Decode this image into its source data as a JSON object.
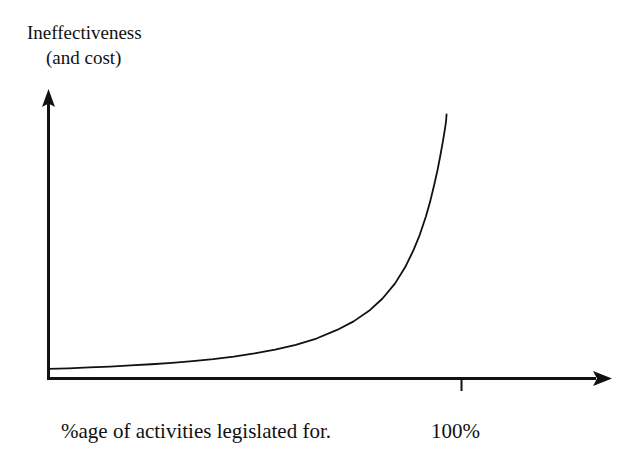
{
  "figure": {
    "background_color": "#ffffff",
    "ink_color": "#111111",
    "width": 635,
    "height": 464
  },
  "labels": {
    "y_axis_line1": "Ineffectiveness",
    "y_axis_line2": "(and cost)",
    "x_axis_main": "%age of activities legislated for.",
    "x_axis_max_tick": "100%"
  },
  "chart_data": {
    "type": "line",
    "title": "",
    "subtitle": "",
    "xlabel": "%age of activities legislated for.",
    "ylabel": "Ineffectiveness (and cost)",
    "grid": false,
    "legend": false,
    "legend_position": "none",
    "axis_style": "arrow-headed open axes, no numeric scale",
    "xlim": [
      0,
      1.18
    ],
    "ylim": [
      0,
      1.0
    ],
    "x_tick_labels": [
      "100%"
    ],
    "x_tick_values": [
      1.0
    ],
    "y_tick_labels": [],
    "y_tick_values": [],
    "annotations": [
      {
        "text": "100%",
        "x": 1.0,
        "y": 0,
        "note": "tick mark on x-axis below the baseline"
      }
    ],
    "series": [
      {
        "name": "Ineffectiveness (and cost)",
        "color": "#111111",
        "line_width": 1.8,
        "description": "Cost/ineffectiveness stays near zero for low percentages of activities legislated for, then rises hyperbolically and approaches a vertical asymptote as 100% is approached.",
        "asymptote_x": 0.965,
        "x": [
          0.0,
          0.05,
          0.1,
          0.15,
          0.2,
          0.25,
          0.3,
          0.35,
          0.4,
          0.45,
          0.5,
          0.55,
          0.6,
          0.65,
          0.7,
          0.74,
          0.78,
          0.81,
          0.84,
          0.865,
          0.885,
          0.9,
          0.915,
          0.925,
          0.935,
          0.943,
          0.95,
          0.955,
          0.959,
          0.962,
          0.964,
          0.965
        ],
        "y": [
          0.032,
          0.034,
          0.037,
          0.04,
          0.044,
          0.048,
          0.053,
          0.059,
          0.066,
          0.075,
          0.086,
          0.099,
          0.116,
          0.138,
          0.168,
          0.198,
          0.238,
          0.278,
          0.33,
          0.388,
          0.447,
          0.5,
          0.565,
          0.615,
          0.675,
          0.726,
          0.778,
          0.818,
          0.852,
          0.879,
          0.9,
          0.922
        ]
      }
    ]
  },
  "axes": {
    "y_axis": {
      "name": "vertical-axis",
      "arrow": "up",
      "origin_px": [
        48,
        378
      ],
      "end_px": [
        48,
        90
      ]
    },
    "x_axis": {
      "name": "horizontal-axis",
      "arrow": "right",
      "origin_px": [
        48,
        378
      ],
      "end_px": [
        612,
        378
      ]
    },
    "tick": {
      "name": "hundred-percent-tick",
      "x_px": 461,
      "y_from_px": 378,
      "y_to_px": 391
    }
  }
}
